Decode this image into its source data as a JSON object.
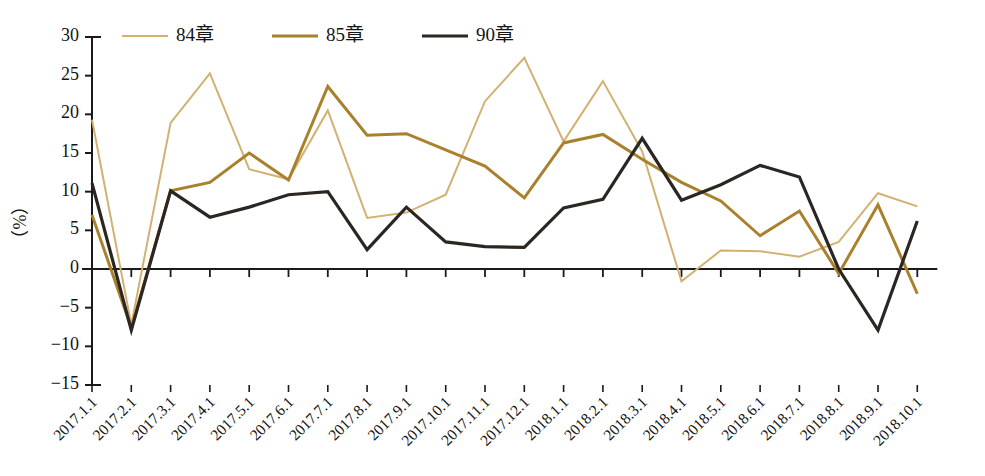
{
  "chart_data": {
    "type": "line",
    "title": "",
    "xlabel": "",
    "ylabel": "（%）",
    "ylim": [
      -15,
      30
    ],
    "yticks": [
      30,
      25,
      20,
      15,
      10,
      5,
      0,
      -5,
      -10,
      -15
    ],
    "ytick_labels": [
      "30",
      "25",
      "20",
      "15",
      "10",
      "5",
      "0",
      "−5",
      "−10",
      "−15"
    ],
    "grid": false,
    "legend_position": "top-left",
    "zero_line": true,
    "categories": [
      "2017.1.1",
      "2017.2.1",
      "2017.3.1",
      "2017.4.1",
      "2017.5.1",
      "2017.6.1",
      "2017.7.1",
      "2017.8.1",
      "2017.9.1",
      "2017.10.1",
      "2017.11.1",
      "2017.12.1",
      "2018.1.1",
      "2018.2.1",
      "2018.3.1",
      "2018.4.1",
      "2018.5.1",
      "2018.6.1",
      "2018.7.1",
      "2018.8.1",
      "2018.9.1",
      "2018.10.1"
    ],
    "series": [
      {
        "name": "84章",
        "color": "#d2b172",
        "width": 2.0,
        "values": [
          19.3,
          -7.2,
          18.9,
          25.3,
          12.9,
          11.6,
          20.5,
          6.6,
          7.3,
          9.6,
          21.7,
          27.3,
          16.5,
          24.3,
          15.2,
          -1.6,
          2.4,
          2.3,
          1.6,
          3.5,
          9.8,
          8.1
        ]
      },
      {
        "name": "85章",
        "color": "#a9812c",
        "width": 3.0,
        "values": [
          7.0,
          -7.6,
          10.1,
          11.2,
          15.0,
          11.5,
          23.6,
          17.3,
          17.5,
          15.4,
          13.3,
          9.2,
          16.3,
          17.4,
          14.2,
          11.2,
          8.8,
          4.3,
          7.5,
          -0.6,
          8.3,
          -3.2
        ]
      },
      {
        "name": "90章",
        "color": "#2b2621",
        "width": 3.2,
        "values": [
          11.1,
          -7.9,
          10.1,
          6.7,
          8.0,
          9.6,
          10.0,
          2.5,
          8.0,
          3.5,
          2.9,
          2.8,
          7.9,
          9.0,
          16.9,
          8.9,
          10.9,
          13.4,
          11.9,
          0.0,
          -7.9,
          6.2
        ]
      }
    ],
    "legend": [
      {
        "label": "84章",
        "color": "#d2b172"
      },
      {
        "label": "85章",
        "color": "#a9812c"
      },
      {
        "label": "90章",
        "color": "#2b2621"
      }
    ]
  }
}
